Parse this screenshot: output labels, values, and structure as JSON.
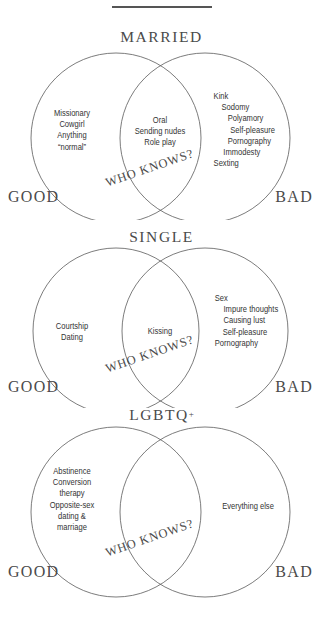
{
  "page": {
    "background_color": "#ffffff",
    "ink_color": "#3a3a3a",
    "top_rule": "divider"
  },
  "labels": {
    "good": "GOOD",
    "bad": "BAD",
    "who_knows": "WHO KNOWS?"
  },
  "diagrams": [
    {
      "title": "MARRIED",
      "title_plus": "",
      "left_items": [
        "Missionary",
        "Cowgirl",
        "Anything",
        "“normal”"
      ],
      "center_items": [
        "Oral",
        "Sending nudes",
        "Role play"
      ],
      "right_items": [
        "Kink",
        "Sodomy",
        "Polyamory",
        "Self-pleasure",
        "Pornography",
        "Immodesty",
        "Sexting"
      ],
      "overlap_label": "WHO KNOWS?",
      "good": "GOOD",
      "bad": "BAD"
    },
    {
      "title": "SINGLE",
      "title_plus": "",
      "left_items": [
        "Courtship",
        "Dating"
      ],
      "center_items": [
        "Kissing"
      ],
      "right_items": [
        "Sex",
        "Impure thoughts",
        "Causing lust",
        "Self-pleasure",
        "Pornography"
      ],
      "overlap_label": "WHO KNOWS?",
      "good": "GOOD",
      "bad": "BAD"
    },
    {
      "title": "LGBTQ",
      "title_plus": "+",
      "left_items": [
        "Abstinence",
        "Conversion",
        "therapy",
        "Opposite-sex",
        "dating &",
        "marriage"
      ],
      "center_items": [],
      "right_items": [
        "Everything else"
      ],
      "overlap_label": "WHO KNOWS?",
      "good": "GOOD",
      "bad": "BAD"
    }
  ]
}
